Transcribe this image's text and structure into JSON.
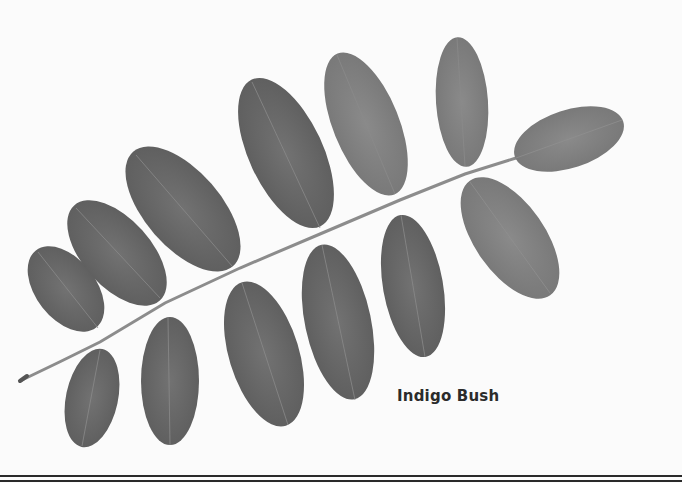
{
  "figure": {
    "caption": "Indigo Bush",
    "colors": {
      "background": "#fbfbfb",
      "leaf_dark": "#5a5a5a",
      "leaf_mid": "#747474",
      "leaf_light": "#8a8a8a",
      "stem": "#8c8c8c",
      "rule": "#2a2a2a"
    },
    "leaflets_upper": 6,
    "leaflets_lower": 6,
    "terminal_leaflet": 1
  }
}
